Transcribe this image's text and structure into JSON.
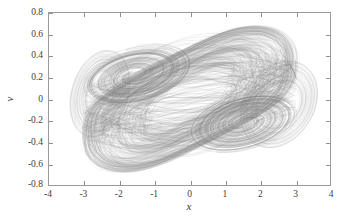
{
  "figure": {
    "background_color": "#ffffff",
    "axes_color": "#9a9a9a",
    "trace_color": "#808080"
  },
  "axis_titles": {
    "x": "x",
    "y": "v"
  },
  "chart_data": {
    "type": "scatter",
    "title": "",
    "subtitle": "",
    "xlabel": "x",
    "ylabel": "v",
    "xlim": [
      -4,
      4
    ],
    "ylim": [
      -0.8,
      0.8
    ],
    "xticks": [
      -4,
      -3,
      -2,
      -1,
      0,
      1,
      2,
      3,
      4
    ],
    "yticks": [
      0.8,
      0.6,
      0.4,
      0.2,
      0,
      -0.2,
      -0.4,
      -0.6,
      -0.8
    ],
    "xtick_labels": [
      "-4",
      "-3",
      "-2",
      "-1",
      "0",
      "1",
      "2",
      "3",
      "4"
    ],
    "ytick_labels": [
      "0.8",
      "0.6",
      "0.4",
      "0.2",
      "0",
      "-0.2",
      "-0.4",
      "-0.6",
      "-0.8"
    ],
    "grid": false,
    "legend": null,
    "annotations": [],
    "series": [
      {
        "name": "chaotic attractor trajectory",
        "description": "Dense phase-space trajectory of a chaotic oscillator forming a tilted lens-shaped double-scroll attractor with two spiral foci",
        "color": "#808080",
        "line_width": 0.3,
        "data_extent": {
          "x_min": -3.05,
          "x_max": 3.05,
          "y_min": -0.68,
          "y_max": 0.68
        },
        "spiral_foci": [
          {
            "x": -1.55,
            "y": 0.22
          },
          {
            "x": 1.55,
            "y": -0.22
          }
        ],
        "lobe_centers": [
          {
            "x": -2.55,
            "y": 0.05
          },
          {
            "x": 2.55,
            "y": -0.05
          }
        ],
        "outline_hull": [
          [
            -2.2,
            0.66
          ],
          [
            -1.2,
            0.675
          ],
          [
            -0.2,
            0.665
          ],
          [
            0.6,
            0.63
          ],
          [
            1.35,
            0.57
          ],
          [
            1.95,
            0.52
          ],
          [
            2.45,
            0.47
          ],
          [
            2.8,
            0.38
          ],
          [
            3.02,
            0.22
          ],
          [
            3.05,
            0.05
          ],
          [
            2.95,
            -0.12
          ],
          [
            2.7,
            -0.28
          ],
          [
            2.35,
            -0.4
          ],
          [
            1.9,
            -0.5
          ],
          [
            1.35,
            -0.58
          ],
          [
            0.7,
            -0.645
          ],
          [
            0.05,
            -0.675
          ],
          [
            -0.7,
            -0.675
          ],
          [
            -1.4,
            -0.665
          ],
          [
            -2.05,
            -0.63
          ],
          [
            -2.55,
            -0.57
          ],
          [
            -2.85,
            -0.45
          ],
          [
            -3.0,
            -0.28
          ],
          [
            -3.05,
            -0.08
          ],
          [
            -2.98,
            0.12
          ],
          [
            -2.8,
            0.3
          ],
          [
            -2.55,
            0.45
          ],
          [
            -2.4,
            0.58
          ]
        ]
      }
    ]
  }
}
